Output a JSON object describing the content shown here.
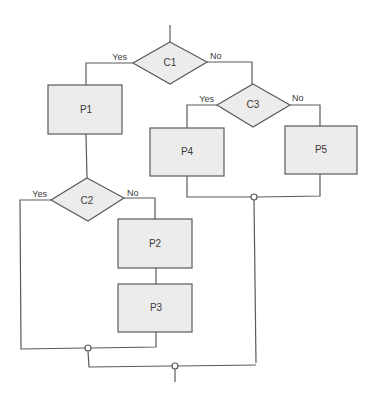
{
  "diagram": {
    "type": "flowchart",
    "colors": {
      "line": "#5a5a5a",
      "shape_fill": "#ececec",
      "text": "#3a3a3a",
      "background": "#ffffff"
    },
    "decisions": [
      {
        "id": "C1",
        "label": "C1",
        "yes_label": "Yes",
        "no_label": "No"
      },
      {
        "id": "C2",
        "label": "C2",
        "yes_label": "Yes",
        "no_label": "No"
      },
      {
        "id": "C3",
        "label": "C3",
        "yes_label": "Yes",
        "no_label": "No"
      }
    ],
    "processes": [
      {
        "id": "P1",
        "label": "P1"
      },
      {
        "id": "P2",
        "label": "P2"
      },
      {
        "id": "P3",
        "label": "P3"
      },
      {
        "id": "P4",
        "label": "P4"
      },
      {
        "id": "P5",
        "label": "P5"
      }
    ],
    "edges": [
      {
        "from": "start",
        "to": "C1"
      },
      {
        "from": "C1",
        "to": "P1",
        "label": "Yes"
      },
      {
        "from": "C1",
        "to": "C3",
        "label": "No"
      },
      {
        "from": "P1",
        "to": "C2"
      },
      {
        "from": "C2",
        "to": "J2",
        "label": "Yes"
      },
      {
        "from": "C2",
        "to": "P2",
        "label": "No"
      },
      {
        "from": "P2",
        "to": "P3"
      },
      {
        "from": "P3",
        "to": "J2"
      },
      {
        "from": "C3",
        "to": "P4",
        "label": "Yes"
      },
      {
        "from": "C3",
        "to": "P5",
        "label": "No"
      },
      {
        "from": "P4",
        "to": "J1"
      },
      {
        "from": "P5",
        "to": "J1"
      },
      {
        "from": "J1",
        "to": "J3"
      },
      {
        "from": "J2",
        "to": "J3"
      },
      {
        "from": "J3",
        "to": "end"
      }
    ]
  }
}
